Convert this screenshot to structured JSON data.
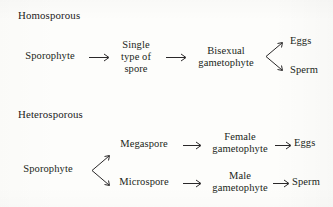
{
  "figure": {
    "background_color": "#fdfdfb",
    "ink_color": "#211f20"
  },
  "sections": [
    {
      "id": "homosporous",
      "title": "Homosporous",
      "nodes": [
        {
          "id": "homo-sporophyte",
          "label": "Sporophyte"
        },
        {
          "id": "homo-spore",
          "label": "Single\ntype of\nspore"
        },
        {
          "id": "homo-gametophyte",
          "label": "Bisexual\ngametophyte"
        },
        {
          "id": "homo-eggs",
          "label": "Eggs"
        },
        {
          "id": "homo-sperm",
          "label": "Sperm"
        }
      ],
      "connectors": [
        {
          "id": "homo-arrow-1",
          "kind": "arrow-right"
        },
        {
          "id": "homo-arrow-2",
          "kind": "arrow-right"
        },
        {
          "id": "homo-branch",
          "kind": "branch-split"
        }
      ]
    },
    {
      "id": "heterosporous",
      "title": "Heterosporous",
      "nodes": [
        {
          "id": "hetero-sporophyte",
          "label": "Sporophyte"
        },
        {
          "id": "hetero-megaspore",
          "label": "Megaspore"
        },
        {
          "id": "hetero-female-gametophyte",
          "label": "Female\ngametophyte"
        },
        {
          "id": "hetero-eggs",
          "label": "Eggs"
        },
        {
          "id": "hetero-microspore",
          "label": "Microspore"
        },
        {
          "id": "hetero-male-gametophyte",
          "label": "Male\ngametophyte"
        },
        {
          "id": "hetero-sperm",
          "label": "Sperm"
        }
      ],
      "connectors": [
        {
          "id": "hetero-branch",
          "kind": "branch-split"
        },
        {
          "id": "hetero-arrow-mega",
          "kind": "arrow-right"
        },
        {
          "id": "hetero-arrow-female",
          "kind": "arrow-right"
        },
        {
          "id": "hetero-arrow-micro",
          "kind": "arrow-right"
        },
        {
          "id": "hetero-arrow-male",
          "kind": "arrow-right"
        }
      ]
    }
  ]
}
